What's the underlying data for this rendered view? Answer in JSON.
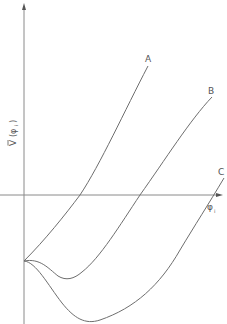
{
  "figure": {
    "y_axis_label": "Ṽ (φᵢ)",
    "y_axis_label_main": "V",
    "y_axis_label_arg": "(φ",
    "y_axis_label_sub": "i",
    "y_axis_label_close": ")",
    "x_axis_label_main": "φ",
    "x_axis_label_sub": "i",
    "curves": [
      {
        "label": "A",
        "description": "monotonically increasing from shared start point"
      },
      {
        "label": "B",
        "description": "shallow minimum then increasing"
      },
      {
        "label": "C",
        "description": "deep minimum then increasing"
      }
    ],
    "colors": {
      "line": "#707070",
      "axis": "#808080",
      "text": "#555555"
    }
  }
}
